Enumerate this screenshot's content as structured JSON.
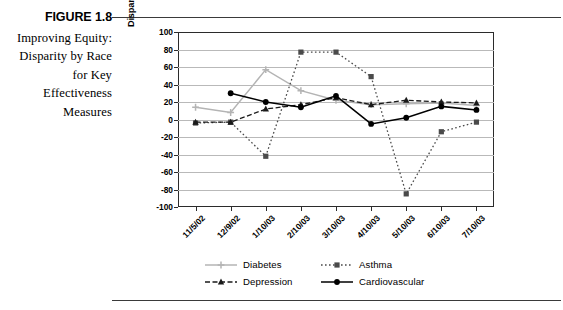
{
  "figure": {
    "number": "FIGURE 1.8",
    "caption": "Improving Equity: Disparity by Race for Key Effectiveness Measures"
  },
  "chart_data": {
    "type": "line",
    "title": "",
    "xlabel": "",
    "ylabel": "Disparity (variation from zero)",
    "ylim": [
      -100,
      100
    ],
    "ytick_step": 20,
    "grid": true,
    "legend_position": "bottom",
    "categories": [
      "11/5/02",
      "12/9/02",
      "1/10/03",
      "2/10/03",
      "3/10/03",
      "4/10/03",
      "5/10/03",
      "6/10/03",
      "7/10/03"
    ],
    "yticks": [
      "100",
      "80",
      "60",
      "40",
      "20",
      "0",
      "-20",
      "-40",
      "-60",
      "-80",
      "-100"
    ],
    "series": [
      {
        "name": "Diabetes",
        "color": "#b4b4b4",
        "marker": "plus",
        "dash": "solid",
        "values": [
          14,
          8,
          57,
          33,
          22,
          17,
          18,
          19,
          16
        ]
      },
      {
        "name": "Asthma",
        "color": "#4a4a4a",
        "marker": "square",
        "dash": "dotted",
        "values": [
          -4,
          -3,
          -42,
          77,
          77,
          49,
          -85,
          -14,
          -3
        ]
      },
      {
        "name": "Depression",
        "color": "#1a1a1a",
        "marker": "triangle",
        "dash": "dashed",
        "values": [
          -3,
          -3,
          12,
          17,
          25,
          17,
          22,
          20,
          19
        ]
      },
      {
        "name": "Cardiovascular",
        "color": "#000000",
        "marker": "circle",
        "dash": "solid",
        "values": [
          null,
          30,
          20,
          14,
          27,
          -5,
          2,
          15,
          11
        ]
      }
    ]
  }
}
